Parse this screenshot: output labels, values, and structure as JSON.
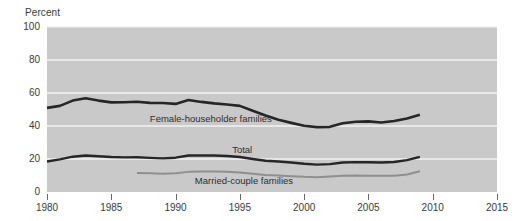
{
  "chart_data": {
    "type": "line",
    "title": "",
    "subtitle": "",
    "xlabel": "",
    "ylabel": "Percent",
    "xlim": [
      1980,
      2015
    ],
    "ylim": [
      0,
      100
    ],
    "grid": true,
    "grid_color": "#f2f2f2",
    "plot_background": "#c9c9c9",
    "legend_position": "inline-annotations",
    "y_ticks": [
      0,
      20,
      40,
      60,
      80,
      100
    ],
    "y_tick_labels": [
      "0",
      "20",
      "40",
      "60",
      "80",
      "100"
    ],
    "x_ticks": [
      1980,
      1985,
      1990,
      1995,
      2000,
      2005,
      2010,
      2015
    ],
    "x_tick_labels": [
      "1980",
      "1985",
      "1990",
      "1995",
      "2000",
      "2005",
      "2010",
      "2015"
    ],
    "annotations": [
      {
        "name": "female-householder-families-label",
        "text": "Female-householder families",
        "x": 1988.0,
        "y": 44.5
      },
      {
        "name": "total-label",
        "text": "Total",
        "x": 1994.4,
        "y": 25.5
      },
      {
        "name": "married-couple-families-label",
        "text": "Married-couple families",
        "x": 1991.5,
        "y": 6.5
      }
    ],
    "series": [
      {
        "name": "Female-householder families",
        "color": "#262626",
        "width": 2.6,
        "x": [
          1980,
          1981,
          1982,
          1983,
          1984,
          1985,
          1986,
          1987,
          1988,
          1989,
          1990,
          1991,
          1992,
          1993,
          1994,
          1995,
          1996,
          1997,
          1998,
          1999,
          2000,
          2001,
          2002,
          2003,
          2004,
          2005,
          2006,
          2007,
          2008,
          2009
        ],
        "values": [
          51.0,
          52.2,
          55.4,
          56.8,
          55.4,
          54.3,
          54.4,
          54.7,
          54.0,
          53.9,
          53.4,
          55.8,
          54.6,
          53.7,
          53.0,
          52.2,
          49.3,
          46.4,
          43.8,
          41.9,
          40.1,
          39.3,
          39.5,
          41.7,
          42.6,
          42.8,
          42.1,
          43.0,
          44.6,
          46.8
        ],
        "draw_start": 1980,
        "draw_end": 2009
      },
      {
        "name": "Total",
        "color": "#262626",
        "width": 2.4,
        "x": [
          1980,
          1981,
          1982,
          1983,
          1984,
          1985,
          1986,
          1987,
          1988,
          1989,
          1990,
          1991,
          1992,
          1993,
          1994,
          1995,
          1996,
          1997,
          1998,
          1999,
          2000,
          2001,
          2002,
          2003,
          2004,
          2005,
          2006,
          2007,
          2008,
          2009
        ],
        "values": [
          18.5,
          19.8,
          21.4,
          22.1,
          21.7,
          21.2,
          21.0,
          21.1,
          20.7,
          20.4,
          20.8,
          22.1,
          22.1,
          22.1,
          21.8,
          21.2,
          20.0,
          18.9,
          18.5,
          17.9,
          17.1,
          16.6,
          16.9,
          17.9,
          18.1,
          18.0,
          17.9,
          18.2,
          19.3,
          21.3
        ]
      },
      {
        "name": "Married-couple families",
        "color": "#8f8f8f",
        "width": 2.0,
        "x": [
          1987,
          1988,
          1989,
          1990,
          1991,
          1992,
          1993,
          1994,
          1995,
          1996,
          1997,
          1998,
          1999,
          2000,
          2001,
          2002,
          2003,
          2004,
          2005,
          2006,
          2007,
          2008,
          2009
        ],
        "values": [
          11.5,
          11.3,
          11.1,
          11.3,
          12.2,
          12.5,
          12.4,
          12.2,
          11.8,
          11.0,
          10.3,
          10.0,
          9.6,
          9.2,
          9.0,
          9.4,
          9.8,
          10.0,
          9.9,
          9.8,
          9.9,
          10.6,
          12.6
        ],
        "draw_start": 1987,
        "draw_end": 2009
      }
    ]
  },
  "axis": {
    "y_title": "Percent"
  }
}
